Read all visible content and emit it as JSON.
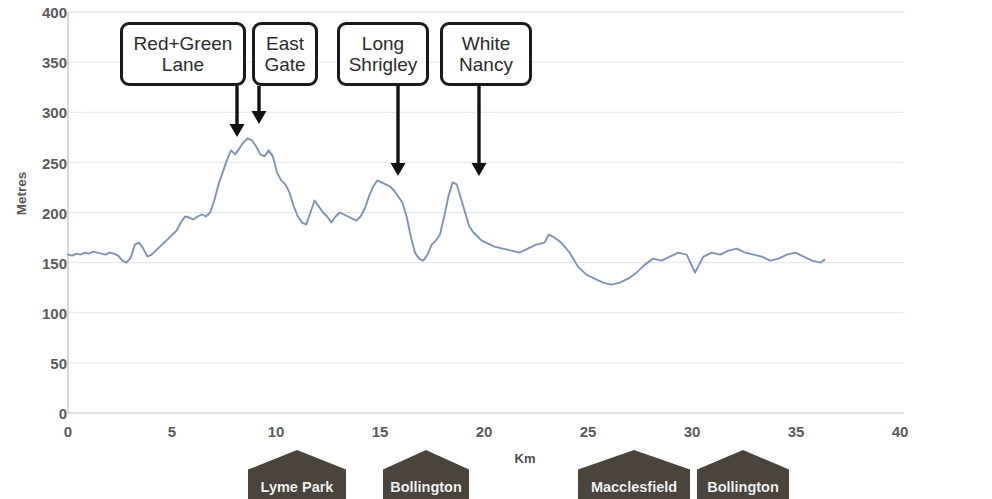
{
  "chart_data": {
    "type": "line",
    "title": "",
    "xlabel": "Km",
    "ylabel": "Metres",
    "xlim": [
      0,
      40
    ],
    "ylim": [
      0,
      400
    ],
    "xticks": [
      0,
      5,
      10,
      15,
      20,
      25,
      30,
      35,
      40
    ],
    "yticks": [
      0,
      50,
      100,
      150,
      200,
      250,
      300,
      350,
      400
    ],
    "grid": "horizontal",
    "legend": "none",
    "line_color": "#7d93b4",
    "series": [
      {
        "name": "Elevation profile",
        "x": [
          0.0,
          0.2,
          0.4,
          0.6,
          0.8,
          1.0,
          1.2,
          1.4,
          1.6,
          1.8,
          2.0,
          2.2,
          2.4,
          2.6,
          2.8,
          3.0,
          3.2,
          3.4,
          3.6,
          3.8,
          4.0,
          4.2,
          4.4,
          4.6,
          4.8,
          5.0,
          5.2,
          5.4,
          5.6,
          5.8,
          6.0,
          6.2,
          6.4,
          6.6,
          6.8,
          7.0,
          7.2,
          7.4,
          7.6,
          7.8,
          8.0,
          8.2,
          8.4,
          8.6,
          8.8,
          9.0,
          9.2,
          9.4,
          9.6,
          9.8,
          10.0,
          10.2,
          10.4,
          10.6,
          10.8,
          11.0,
          11.2,
          11.4,
          11.6,
          11.8,
          12.0,
          12.2,
          12.4,
          12.6,
          12.8,
          13.0,
          13.2,
          13.4,
          13.6,
          13.8,
          14.0,
          14.2,
          14.4,
          14.6,
          14.8,
          15.0,
          15.2,
          15.4,
          15.6,
          15.8,
          16.0,
          16.2,
          16.4,
          16.6,
          16.8,
          17.0,
          17.2,
          17.4,
          17.6,
          17.8,
          18.0,
          18.2,
          18.4,
          18.6,
          18.8,
          19.0,
          19.2,
          19.4,
          19.6,
          19.8,
          20.0,
          20.4,
          20.8,
          21.2,
          21.6,
          22.0,
          22.4,
          22.8,
          23.0,
          23.2,
          23.6,
          24.0,
          24.4,
          24.8,
          25.2,
          25.6,
          26.0,
          26.4,
          26.8,
          27.2,
          27.6,
          28.0,
          28.4,
          28.8,
          29.2,
          29.6,
          30.0,
          30.4,
          30.8,
          31.2,
          31.6,
          32.0,
          32.4,
          32.8,
          33.2,
          33.6,
          34.0,
          34.4,
          34.8,
          35.2,
          35.6,
          36.0,
          36.2
        ],
        "y": [
          158,
          157,
          159,
          158,
          160,
          159,
          161,
          160,
          159,
          158,
          160,
          159,
          157,
          152,
          150,
          155,
          168,
          170,
          164,
          156,
          158,
          162,
          166,
          170,
          174,
          178,
          182,
          190,
          196,
          195,
          193,
          196,
          198,
          196,
          200,
          212,
          228,
          240,
          252,
          262,
          258,
          264,
          270,
          274,
          272,
          266,
          258,
          256,
          262,
          256,
          240,
          232,
          228,
          220,
          206,
          196,
          190,
          188,
          200,
          212,
          206,
          200,
          196,
          190,
          196,
          200,
          198,
          196,
          194,
          192,
          196,
          204,
          216,
          226,
          232,
          230,
          228,
          226,
          222,
          216,
          210,
          196,
          176,
          160,
          154,
          152,
          158,
          168,
          172,
          178,
          196,
          216,
          230,
          228,
          214,
          200,
          186,
          180,
          176,
          172,
          170,
          166,
          164,
          162,
          160,
          164,
          168,
          170,
          178,
          176,
          170,
          160,
          146,
          138,
          134,
          130,
          128,
          130,
          134,
          140,
          148,
          154,
          152,
          156,
          160,
          158,
          140,
          156,
          160,
          158,
          162,
          164,
          160,
          158,
          156,
          152,
          154,
          158,
          160,
          156,
          152,
          150,
          153
        ]
      }
    ],
    "callouts": [
      {
        "id": "red-green-lane",
        "label": "Red+Green\nLane",
        "box": {
          "left": 120,
          "top": 22,
          "width": 126,
          "height": 64
        },
        "arrow": {
          "from_x": 237,
          "from_y": 86,
          "to_y": 137
        }
      },
      {
        "id": "east-gate",
        "label": "East\nGate",
        "box": {
          "left": 252,
          "top": 22,
          "width": 66,
          "height": 64
        },
        "arrow": {
          "from_x": 259,
          "from_y": 86,
          "to_y": 124
        }
      },
      {
        "id": "long-shrigley",
        "label": "Long\nShrigley",
        "box": {
          "left": 337,
          "top": 22,
          "width": 92,
          "height": 64
        },
        "arrow": {
          "from_x": 398,
          "from_y": 86,
          "to_y": 176
        }
      },
      {
        "id": "white-nancy",
        "label": "White\nNancy",
        "box": {
          "left": 440,
          "top": 22,
          "width": 92,
          "height": 64
        },
        "arrow": {
          "from_x": 479,
          "from_y": 86,
          "to_y": 176
        }
      }
    ],
    "place_markers": [
      {
        "id": "lyme-park",
        "label": "Lyme Park",
        "left": 248,
        "width": 98,
        "km": 10.6
      },
      {
        "id": "bollington-1",
        "label": "Bollington",
        "left": 383,
        "width": 86,
        "km": 15.5
      },
      {
        "id": "macclesfield",
        "label": "Macclesfield",
        "left": 578,
        "width": 112,
        "km": 24.6
      },
      {
        "id": "bollington-2",
        "label": "Bollington",
        "left": 697,
        "width": 92,
        "km": 29.8
      }
    ]
  },
  "axis": {
    "y_title": "Metres",
    "x_title": "Km",
    "y_labels": [
      "400",
      "350",
      "300",
      "250",
      "200",
      "150",
      "100",
      "50",
      "0"
    ],
    "x_labels": [
      "0",
      "5",
      "10",
      "15",
      "20",
      "25",
      "30",
      "35",
      "40"
    ]
  }
}
